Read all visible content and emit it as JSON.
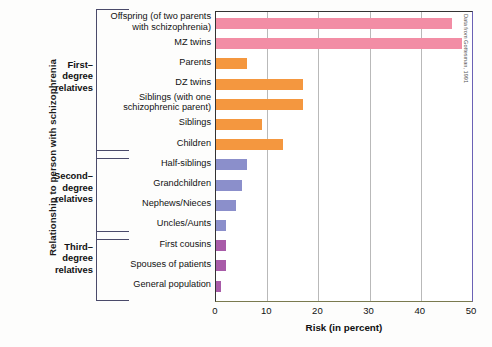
{
  "chart_data": {
    "type": "bar",
    "orientation": "horizontal",
    "title": "",
    "xlabel": "Risk (in percent)",
    "ylabel": "Relationship to person with schizophrenia",
    "xlim": [
      0,
      50
    ],
    "xticks": [
      0,
      10,
      20,
      30,
      40,
      50
    ],
    "xtick_labels": [
      "0",
      "10",
      "20",
      "30",
      "40",
      "50"
    ],
    "grid": "vertical",
    "legend": "none",
    "source_note": "Data from Gottesman, 1991",
    "categories": [
      "Offspring (of two parents with schizophrenia)",
      "MZ twins",
      "Parents",
      "DZ twins",
      "Siblings (with one schizophrenic parent)",
      "Siblings",
      "Children",
      "Half-siblings",
      "Grandchildren",
      "Nephews/Nieces",
      "Uncles/Aunts",
      "First cousins",
      "Spouses of patients",
      "General population"
    ],
    "values": [
      46,
      48,
      6,
      17,
      17,
      9,
      13,
      6,
      5,
      4,
      2,
      2,
      2,
      1
    ],
    "bar_colors": [
      "#f28da5",
      "#f28da5",
      "#f4973f",
      "#f4973f",
      "#f4973f",
      "#f4973f",
      "#f4973f",
      "#8b8fcb",
      "#8b8fcb",
      "#8b8fcb",
      "#8b8fcb",
      "#a85ba8",
      "#a85ba8",
      "#a85ba8"
    ],
    "groups": [
      {
        "label": "First–\ndegree\nrelatives",
        "label_lines": [
          "First–",
          "degree",
          "relatives"
        ],
        "from_index": 0,
        "to_index": 6
      },
      {
        "label": "Second–\ndegree\nrelatives",
        "label_lines": [
          "Second–",
          "degree",
          "relatives"
        ],
        "from_index": 7,
        "to_index": 10
      },
      {
        "label": "Third–\ndegree\nrelatives",
        "label_lines": [
          "Third–",
          "degree",
          "relatives"
        ],
        "from_index": 11,
        "to_index": 13
      }
    ],
    "category_label_lines": [
      [
        "Offspring (of two parents",
        "with schizophrenia)"
      ],
      [
        "MZ twins"
      ],
      [
        "Parents"
      ],
      [
        "DZ twins"
      ],
      [
        "Siblings (with one",
        "schizophrenic parent)"
      ],
      [
        "Siblings"
      ],
      [
        "Children"
      ],
      [
        "Half-siblings"
      ],
      [
        "Grandchildren"
      ],
      [
        "Nephews/Nieces"
      ],
      [
        "Uncles/Aunts"
      ],
      [
        "First cousins"
      ],
      [
        "Spouses  of patients"
      ],
      [
        "General population"
      ]
    ]
  },
  "colors": {
    "pink": "#f28da5",
    "orange": "#f4973f",
    "blue_purple": "#8b8fcb",
    "magenta": "#a85ba8",
    "gridline": "#b9b9b9",
    "axis": "#333333"
  }
}
